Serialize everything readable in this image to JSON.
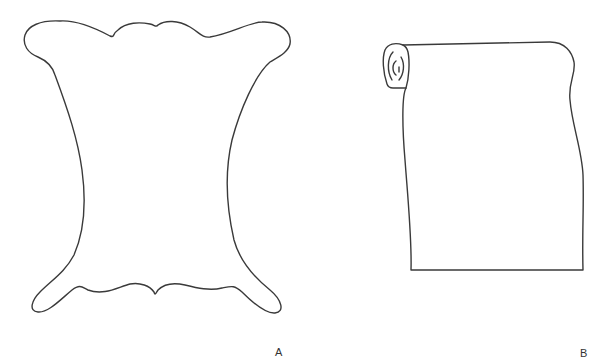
{
  "figure": {
    "panels": [
      {
        "id": "A",
        "label": "A",
        "depicts": "animal-hide-outline"
      },
      {
        "id": "B",
        "label": "B",
        "depicts": "rolled-parchment-scroll"
      }
    ],
    "colors": {
      "background": "#ffffff",
      "stroke": "#3a3a3a",
      "text": "#333333"
    }
  }
}
